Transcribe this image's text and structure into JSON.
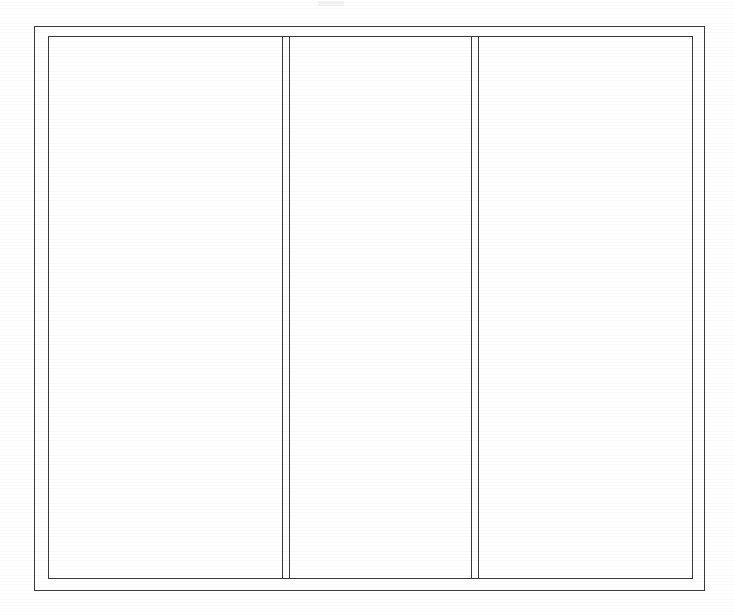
{
  "document": {
    "kind": "scanned-line-drawing",
    "title": "Trifold panel layout",
    "orientation": "landscape",
    "page_background": "#ffffff",
    "ink_color": "#3a3a3a",
    "width_px": 734,
    "height_px": 615,
    "visible_text": "",
    "notes_label": ""
  },
  "frame": {
    "outer": {
      "label": "outer border",
      "left": 34,
      "top": 26,
      "width": 671,
      "height": 565,
      "stroke": "#3a3a3a",
      "stroke_width": 1
    },
    "inner": {
      "label": "inner border",
      "left": 48,
      "top": 36,
      "width": 645,
      "height": 543,
      "stroke": "#3a3a3a",
      "stroke_width": 1
    }
  },
  "dividers": [
    {
      "label": "divider-1",
      "line_a_x": 282,
      "line_b_x": 289,
      "top": 36,
      "bottom": 579,
      "stroke": "#3a3a3a"
    },
    {
      "label": "divider-2",
      "line_a_x": 471,
      "line_b_x": 478,
      "top": 36,
      "bottom": 579,
      "stroke": "#3a3a3a"
    }
  ],
  "panels": [
    {
      "name": "left panel",
      "content": "",
      "width": 234
    },
    {
      "name": "center panel",
      "content": "",
      "width": 182
    },
    {
      "name": "right panel",
      "content": "",
      "width": 213
    }
  ],
  "artifacts": [
    {
      "name": "top-edge scan speck",
      "left": 318,
      "top": 1,
      "width": 26,
      "height": 5
    }
  ]
}
